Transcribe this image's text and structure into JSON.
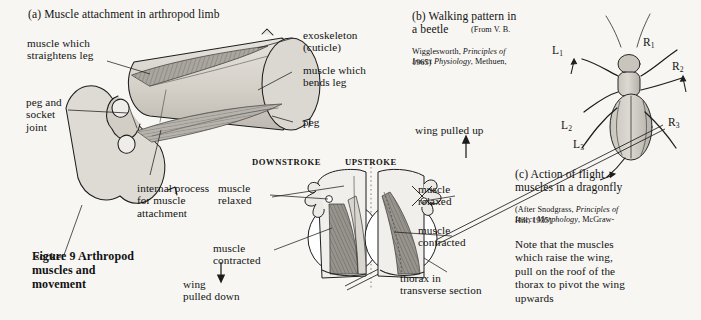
{
  "figure": {
    "caption": "Figure 9   Arthropod\nmuscles and\nmovement"
  },
  "panel_a": {
    "heading": "(a) Muscle attachment in arthropod limb",
    "labels": {
      "straightens": "muscle which\nstraightens leg",
      "peg_socket_joint": "peg and\nsocket\njoint",
      "socket": "socket",
      "internal_process": "internal process\nfor muscle\nattachment",
      "exoskeleton": "exoskeleton\n(cuticle)",
      "bends": "muscle which\nbends leg",
      "peg": "peg"
    }
  },
  "panel_b": {
    "heading": "(b) Walking pattern in\na beetle",
    "citation_lead": "(From V. B.",
    "citation_rest_1_plain": "Wigglesworth, ",
    "citation_rest_1_italic": "Principles of",
    "citation_rest_2_italic": "Insect Physiology",
    "citation_rest_2_plain": ", Methuen,",
    "citation_rest_3": "1965)",
    "leg_labels": {
      "l1": "L",
      "l1_sub": "1",
      "l2": "L",
      "l2_sub": "2",
      "l3": "L",
      "l3_sub": "3",
      "r1": "R",
      "r1_sub": "1",
      "r2": "R",
      "r2_sub": "2",
      "r3": "R",
      "r3_sub": "3"
    }
  },
  "panel_c": {
    "heading": "(c) Action of flight\nmuscles in a dragonfly",
    "citation_lead": "(After Snodgrass, ",
    "citation_italic_1": "Principles of",
    "citation_italic_2": "Insect Morphology",
    "citation_plain_2": ", McGraw-",
    "citation_line_3": "Hill, 1935)",
    "note": "Note that the muscles\nwhich raise the wing,\npull on the roof of the\nthorax to pivot the wing\nupwards",
    "stroke_headings": {
      "downstroke": "DOWNSTROKE",
      "upstroke": "UPSTROKE"
    },
    "labels": {
      "wing_pulled_up": "wing pulled up",
      "wing_pulled_down": "wing\npulled down",
      "left_muscle_relaxed": "muscle\nrelaxed",
      "left_muscle_contracted": "muscle\ncontracted",
      "right_muscle_relaxed": "muscle\nrelaxed",
      "right_muscle_contracted": "muscle\ncontracted",
      "thorax": "thorax in\ntransverse section"
    }
  },
  "colors": {
    "paper": "#f7f6f2",
    "ink": "#121212",
    "shell_light": "#dedbd4",
    "shell_mid": "#c6c2b9",
    "muscle_dark": "#8d8b85",
    "muscle_mid": "#a9a6a0",
    "muscle_light": "#cecbc4"
  }
}
